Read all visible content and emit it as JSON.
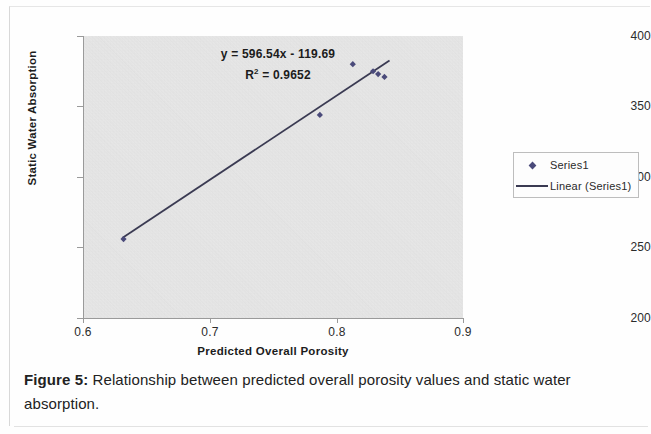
{
  "figure": {
    "caption_lead": "Figure 5:",
    "caption_body": " Relationship between predicted overall porosity values and static water absorption."
  },
  "legend": {
    "items": [
      {
        "label": "Series1",
        "key": "diamond-marker",
        "color": "#4a4a7a"
      },
      {
        "label": "Linear (Series1)",
        "key": "line-swatch",
        "color": "#3a3a52"
      }
    ]
  },
  "annotation": {
    "equation": "y = 596.54x - 119.69",
    "r_squared_prefix": "R",
    "r_squared_sup": "2",
    "r_squared_value": " = 0.9652"
  },
  "axes": {
    "x_label": "Predicted Overall Porosity",
    "y_label": "Static Water Absorption",
    "x_ticks": [
      "0.6",
      "0.7",
      "0.8",
      "0.9"
    ],
    "y_ticks": [
      "400",
      "350",
      "300",
      "250",
      "200"
    ]
  },
  "chart_data": {
    "type": "scatter",
    "title": "",
    "subtitle": "",
    "xlabel": "Predicted Overall Porosity",
    "ylabel": "Static Water Absorption",
    "xlim": [
      0.6,
      0.9
    ],
    "ylim": [
      200,
      400
    ],
    "xticks": [
      0.6,
      0.7,
      0.8,
      0.9
    ],
    "yticks": [
      200,
      250,
      300,
      350,
      400
    ],
    "grid": false,
    "legend_position": "right",
    "annotations": [
      "y = 596.54x - 119.69",
      "R2 = 0.9652"
    ],
    "series": [
      {
        "name": "Series1",
        "type": "scatter",
        "marker": "diamond",
        "color": "#4a4a7a",
        "points": [
          {
            "x": 0.632,
            "y": 256
          },
          {
            "x": 0.787,
            "y": 344
          },
          {
            "x": 0.813,
            "y": 380
          },
          {
            "x": 0.829,
            "y": 375
          },
          {
            "x": 0.833,
            "y": 373
          },
          {
            "x": 0.838,
            "y": 371
          }
        ]
      },
      {
        "name": "Linear (Series1)",
        "type": "line",
        "color": "#3a3a52",
        "slope": 596.54,
        "intercept": -119.69,
        "r_squared": 0.9652,
        "x_start": 0.631,
        "x_end": 0.842,
        "y_start": 256.8,
        "y_end": 382.6
      }
    ]
  }
}
